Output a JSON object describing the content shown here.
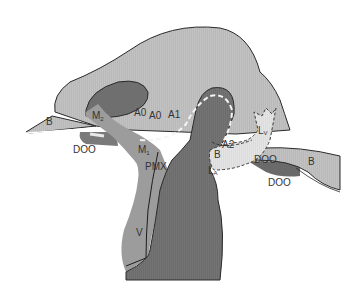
{
  "diagram": {
    "colors": {
      "background": "#ffffff",
      "head_body": "#b9b9b9",
      "dark_region": "#6f6f6f",
      "medium_band": "#9a9a9a",
      "light_sheath": "#dadada",
      "outline": "#2a2a2a",
      "dashed_line": "#f2f2f2"
    },
    "labels": {
      "beak_left": "B",
      "beak_right": "B",
      "doo_left": "DOO",
      "doo_right": "DOO",
      "doo_inner": "DOO",
      "m2": "M",
      "m2_sub": "2",
      "m1": "M",
      "m1_sub": "1",
      "pmx": "PMX",
      "a0_first": "A0",
      "a0_second": "A0",
      "a1": "A1",
      "a2": "A2",
      "b_inner": "B",
      "la": "L",
      "la_sub": "A",
      "lv": "L",
      "lv_sub": "V",
      "v": "V"
    }
  }
}
